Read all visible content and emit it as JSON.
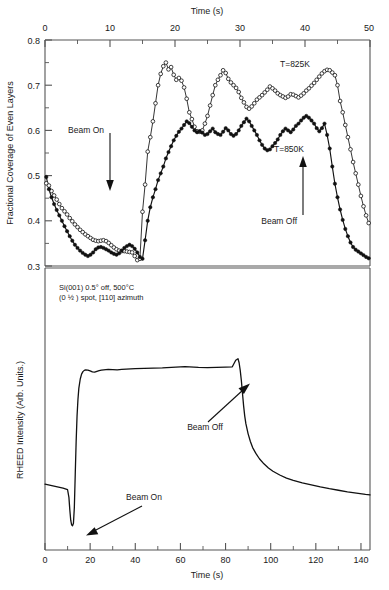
{
  "figure": {
    "title": "",
    "panels": [
      "upper-coverage-panel",
      "lower-rheed-panel"
    ]
  },
  "upper": {
    "xlabel": "Time (s)",
    "ylabel": "Fractional Coverage of Even Layers",
    "xticks": [
      "0",
      "10",
      "20",
      "30",
      "40",
      "50"
    ],
    "yticks": [
      "0.8",
      "0.7",
      "0.6",
      "0.5",
      "0.4",
      "0.3"
    ],
    "series_label_825": "T=825K",
    "series_label_850": "T=850K",
    "annotation_beam_on": "Beam On",
    "annotation_beam_off": "Beam Off"
  },
  "lower": {
    "xlabel": "Time (s)",
    "ylabel": "RHEED Intensity (Arb. Units.)",
    "xticks": [
      "0",
      "20",
      "40",
      "60",
      "80",
      "100",
      "120",
      "140"
    ],
    "caption_line1": "Si(001) 0.5° off, 500°C",
    "caption_line2": "(0 ½ ) spot, [110] azimuth",
    "annotation_beam_on": "Beam On",
    "annotation_beam_off": "Beam Off"
  },
  "chart_data": [
    {
      "type": "line",
      "id": "upper-coverage-panel",
      "title": "",
      "xlabel": "Time (s)",
      "ylabel": "Fractional Coverage of Even Layers",
      "xlim": [
        0,
        50
      ],
      "ylim": [
        0.3,
        0.8
      ],
      "xticks": [
        0,
        10,
        20,
        30,
        40,
        50
      ],
      "yticks": [
        0.3,
        0.4,
        0.5,
        0.6,
        0.7,
        0.8
      ],
      "grid": false,
      "legend_position": "inline-labels",
      "xaxis_position": "top",
      "annotations": [
        {
          "text": "Beam On",
          "x": 10,
          "y": 0.52,
          "arrow": "down",
          "arrow_to_y": 0.42
        },
        {
          "text": "Beam Off",
          "x": 40,
          "y": 0.4,
          "arrow": "up",
          "arrow_to_y": 0.52
        },
        {
          "text": "T=825K",
          "x": 39,
          "y": 0.735
        },
        {
          "text": "T=850K",
          "x": 38,
          "y": 0.565
        }
      ],
      "series": [
        {
          "name": "T=825K",
          "marker": "open-circle",
          "x": [
            0.2,
            0.6,
            1.0,
            1.4,
            1.8,
            2.2,
            2.6,
            3.0,
            3.4,
            3.8,
            4.2,
            4.6,
            5.0,
            5.4,
            5.8,
            6.2,
            6.6,
            7.0,
            7.4,
            7.8,
            8.2,
            8.6,
            9.0,
            9.4,
            9.8,
            10.2,
            10.6,
            11.0,
            11.4,
            11.8,
            12.2,
            12.6,
            13.0,
            13.4,
            13.8,
            14.2,
            14.6,
            15.0,
            15.4,
            15.8,
            16.2,
            16.6,
            17.0,
            17.4,
            17.8,
            18.2,
            18.6,
            19.0,
            19.4,
            19.8,
            20.2,
            20.6,
            21.0,
            21.4,
            21.8,
            22.2,
            22.6,
            23.0,
            23.4,
            23.8,
            24.2,
            24.6,
            25.0,
            25.4,
            25.8,
            26.2,
            26.6,
            27.0,
            27.4,
            27.8,
            28.2,
            28.6,
            29.0,
            29.4,
            29.8,
            30.2,
            30.6,
            31.0,
            31.4,
            31.8,
            32.2,
            32.6,
            33.0,
            33.4,
            33.8,
            34.2,
            34.6,
            35.0,
            35.4,
            35.8,
            36.2,
            36.6,
            37.0,
            37.4,
            37.8,
            38.2,
            38.6,
            39.0,
            39.4,
            39.8,
            40.2,
            40.6,
            41.0,
            41.4,
            41.8,
            42.2,
            42.6,
            43.0,
            43.4,
            43.8,
            44.2,
            44.6,
            45.0,
            45.4,
            45.8,
            46.2,
            46.6,
            47.0,
            47.4,
            47.8,
            48.2,
            48.6,
            49.0,
            49.4,
            49.8
          ],
          "y": [
            0.483,
            0.478,
            0.466,
            0.456,
            0.447,
            0.437,
            0.428,
            0.421,
            0.414,
            0.406,
            0.399,
            0.392,
            0.386,
            0.38,
            0.375,
            0.37,
            0.366,
            0.362,
            0.358,
            0.356,
            0.355,
            0.356,
            0.357,
            0.355,
            0.351,
            0.346,
            0.341,
            0.337,
            0.334,
            0.333,
            0.333,
            0.332,
            0.331,
            0.33,
            0.322,
            0.313,
            0.316,
            0.42,
            0.48,
            0.553,
            0.585,
            0.62,
            0.66,
            0.7,
            0.725,
            0.742,
            0.75,
            0.735,
            0.74,
            0.723,
            0.712,
            0.716,
            0.71,
            0.695,
            0.67,
            0.64,
            0.625,
            0.608,
            0.598,
            0.597,
            0.6,
            0.615,
            0.632,
            0.655,
            0.678,
            0.7,
            0.712,
            0.722,
            0.733,
            0.727,
            0.714,
            0.706,
            0.7,
            0.694,
            0.685,
            0.672,
            0.662,
            0.652,
            0.648,
            0.653,
            0.66,
            0.668,
            0.673,
            0.678,
            0.684,
            0.69,
            0.697,
            0.693,
            0.688,
            0.682,
            0.678,
            0.675,
            0.672,
            0.675,
            0.68,
            0.679,
            0.676,
            0.673,
            0.677,
            0.682,
            0.688,
            0.693,
            0.699,
            0.705,
            0.712,
            0.719,
            0.726,
            0.731,
            0.734,
            0.733,
            0.728,
            0.722,
            0.7,
            0.665,
            0.64,
            0.612,
            0.585,
            0.558,
            0.53,
            0.505,
            0.48,
            0.455,
            0.432,
            0.412,
            0.395,
            0.38,
            0.368,
            0.358,
            0.35,
            0.344,
            0.338,
            0.334,
            0.33,
            0.328,
            0.33,
            0.333
          ],
          "note": "upper open-circle curve, 825 K"
        },
        {
          "name": "T=850K",
          "marker": "filled-circle",
          "x": [
            0.2,
            0.6,
            1.0,
            1.4,
            1.8,
            2.2,
            2.6,
            3.0,
            3.4,
            3.8,
            4.2,
            4.6,
            5.0,
            5.4,
            5.8,
            6.2,
            6.6,
            7.0,
            7.4,
            7.8,
            8.2,
            8.6,
            9.0,
            9.4,
            9.8,
            10.2,
            10.6,
            11.0,
            11.4,
            11.8,
            12.2,
            12.6,
            13.0,
            13.4,
            13.8,
            14.2,
            14.6,
            15.0,
            15.4,
            15.8,
            16.2,
            16.6,
            17.0,
            17.4,
            17.8,
            18.2,
            18.6,
            19.0,
            19.4,
            19.8,
            20.2,
            20.6,
            21.0,
            21.4,
            21.8,
            22.2,
            22.6,
            23.0,
            23.4,
            23.8,
            24.2,
            24.6,
            25.0,
            25.4,
            25.8,
            26.2,
            26.6,
            27.0,
            27.4,
            27.8,
            28.2,
            28.6,
            29.0,
            29.4,
            29.8,
            30.2,
            30.6,
            31.0,
            31.4,
            31.8,
            32.2,
            32.6,
            33.0,
            33.4,
            33.8,
            34.2,
            34.6,
            35.0,
            35.4,
            35.8,
            36.2,
            36.6,
            37.0,
            37.4,
            37.8,
            38.2,
            38.6,
            39.0,
            39.4,
            39.8,
            40.2,
            40.6,
            41.0,
            41.4,
            41.8,
            42.2,
            42.6,
            43.0,
            43.4,
            43.8,
            44.2,
            44.6,
            45.0,
            45.4,
            45.8,
            46.2,
            46.6,
            47.0,
            47.4,
            47.8,
            48.2,
            48.6,
            49.0,
            49.4,
            49.8
          ],
          "y": [
            0.497,
            0.47,
            0.452,
            0.437,
            0.424,
            0.412,
            0.4,
            0.388,
            0.377,
            0.366,
            0.356,
            0.347,
            0.34,
            0.334,
            0.329,
            0.325,
            0.322,
            0.325,
            0.33,
            0.337,
            0.341,
            0.342,
            0.34,
            0.337,
            0.334,
            0.33,
            0.327,
            0.325,
            0.328,
            0.334,
            0.34,
            0.344,
            0.347,
            0.344,
            0.338,
            0.33,
            0.32,
            0.316,
            0.357,
            0.4,
            0.43,
            0.452,
            0.47,
            0.49,
            0.505,
            0.52,
            0.538,
            0.552,
            0.565,
            0.578,
            0.588,
            0.597,
            0.604,
            0.612,
            0.62,
            0.616,
            0.608,
            0.6,
            0.596,
            0.598,
            0.595,
            0.59,
            0.592,
            0.598,
            0.604,
            0.596,
            0.592,
            0.59,
            0.597,
            0.605,
            0.6,
            0.592,
            0.588,
            0.592,
            0.6,
            0.61,
            0.618,
            0.626,
            0.62,
            0.61,
            0.6,
            0.59,
            0.578,
            0.568,
            0.56,
            0.556,
            0.558,
            0.565,
            0.572,
            0.58,
            0.59,
            0.598,
            0.604,
            0.6,
            0.596,
            0.602,
            0.61,
            0.615,
            0.622,
            0.628,
            0.632,
            0.628,
            0.622,
            0.615,
            0.605,
            0.598,
            0.605,
            0.615,
            0.59,
            0.56,
            0.52,
            0.482,
            0.452,
            0.425,
            0.402,
            0.382,
            0.366,
            0.352,
            0.342,
            0.336,
            0.332,
            0.328,
            0.324,
            0.32,
            0.317,
            0.315,
            0.316,
            0.318,
            0.322
          ],
          "note": "lower filled-circle curve, 850 K"
        }
      ]
    },
    {
      "type": "line",
      "id": "lower-rheed-panel",
      "title": "",
      "xlabel": "Time (s)",
      "ylabel": "RHEED Intensity (Arb. Units.)",
      "xlim": [
        0,
        144
      ],
      "ylim": [
        0,
        1
      ],
      "xticks": [
        0,
        20,
        40,
        60,
        80,
        100,
        120,
        140
      ],
      "yticks": [],
      "grid": false,
      "annotations": [
        {
          "text": "Beam On",
          "x": 32,
          "y": 0.22,
          "arrow": "down-left",
          "arrow_to_x": 14,
          "arrow_to_y": 0.07
        },
        {
          "text": "Beam Off",
          "x": 62,
          "y": 0.44,
          "arrow": "up-right",
          "arrow_to_x": 84,
          "arrow_to_y": 0.68
        }
      ],
      "series": [
        {
          "name": "RHEED intensity",
          "marker": "none",
          "x": [
            0,
            2,
            4,
            6,
            8,
            9,
            10,
            10.6,
            11.0,
            11.4,
            11.8,
            12.2,
            12.6,
            13.0,
            13.4,
            13.8,
            14.2,
            14.6,
            15.0,
            15.6,
            16.2,
            16.8,
            17.4,
            18.0,
            19.0,
            20.0,
            21.0,
            22.0,
            23.0,
            24.0,
            25.0,
            26.0,
            27.0,
            28.0,
            30.0,
            32.0,
            34.0,
            36.0,
            38.0,
            40.0,
            44.0,
            48.0,
            52.0,
            56.0,
            60.0,
            62.0,
            64.0,
            68.0,
            72.0,
            76.0,
            80.0,
            83.0,
            84.5,
            85.5,
            86.0,
            86.5,
            87.0,
            87.5,
            88.0,
            88.5,
            89.0,
            90.0,
            91.0,
            92.0,
            93.5,
            95.0,
            97.0,
            99.0,
            101.0,
            104.0,
            107.0,
            110.0,
            114.0,
            118.0,
            122.0,
            126.0,
            130.0,
            134.0,
            138.0,
            142.0,
            144.0
          ],
          "y": [
            0.212,
            0.208,
            0.204,
            0.2,
            0.196,
            0.193,
            0.19,
            0.16,
            0.11,
            0.07,
            0.052,
            0.048,
            0.058,
            0.12,
            0.25,
            0.38,
            0.48,
            0.545,
            0.59,
            0.625,
            0.645,
            0.655,
            0.66,
            0.662,
            0.661,
            0.658,
            0.654,
            0.653,
            0.656,
            0.659,
            0.661,
            0.662,
            0.663,
            0.664,
            0.663,
            0.662,
            0.664,
            0.665,
            0.666,
            0.667,
            0.668,
            0.669,
            0.67,
            0.672,
            0.674,
            0.675,
            0.674,
            0.672,
            0.671,
            0.672,
            0.673,
            0.674,
            0.7,
            0.706,
            0.69,
            0.66,
            0.62,
            0.57,
            0.52,
            0.48,
            0.45,
            0.41,
            0.38,
            0.356,
            0.332,
            0.312,
            0.292,
            0.276,
            0.263,
            0.248,
            0.236,
            0.227,
            0.217,
            0.209,
            0.201,
            0.194,
            0.188,
            0.182,
            0.177,
            0.172,
            0.17
          ],
          "note": "RHEED intensity vs time; sharp dip at beam on (~12 s), plateau, spike and decay at beam off (~86 s)"
        }
      ]
    }
  ]
}
